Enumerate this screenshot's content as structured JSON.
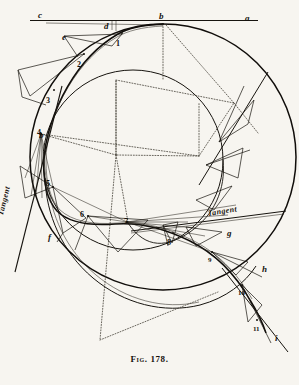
{
  "figure": {
    "caption": "Fig. 178.",
    "background_color": "#f7f5f0",
    "ink_color": "#15120e"
  },
  "annotations": {
    "tangent_left": "Tangent",
    "tangent_right": "Tangent"
  },
  "letter_labels": [
    {
      "id": "c",
      "text": "c",
      "x": 38,
      "y": 11
    },
    {
      "id": "d",
      "text": "d",
      "x": 104,
      "y": 22
    },
    {
      "id": "b",
      "text": "b",
      "x": 159,
      "y": 12
    },
    {
      "id": "a",
      "text": "a",
      "x": 245,
      "y": 14
    },
    {
      "id": "e",
      "text": "e",
      "x": 62,
      "y": 33
    },
    {
      "id": "b2",
      "text": "b",
      "x": 39,
      "y": 131
    },
    {
      "id": "f",
      "text": "f",
      "x": 48,
      "y": 233
    },
    {
      "id": "g",
      "text": "g",
      "x": 227,
      "y": 229
    },
    {
      "id": "h",
      "text": "h",
      "x": 262,
      "y": 265
    },
    {
      "id": "i",
      "text": "i",
      "x": 275,
      "y": 334
    }
  ],
  "number_labels": [
    {
      "id": "1",
      "text": "1",
      "x": 116,
      "y": 40
    },
    {
      "id": "2",
      "text": "2",
      "x": 77,
      "y": 61
    },
    {
      "id": "3",
      "text": "3",
      "x": 46,
      "y": 97
    },
    {
      "id": "4",
      "text": "4",
      "x": 37,
      "y": 129
    },
    {
      "id": "5",
      "text": "5",
      "x": 46,
      "y": 180
    },
    {
      "id": "6",
      "text": "6",
      "x": 80,
      "y": 211
    },
    {
      "id": "7",
      "text": "7",
      "x": 124,
      "y": 218
    },
    {
      "id": "8",
      "text": "8",
      "x": 167,
      "y": 239
    },
    {
      "id": "9",
      "text": "9",
      "x": 208,
      "y": 257
    },
    {
      "id": "10",
      "text": "10",
      "x": 238,
      "y": 290
    },
    {
      "id": "11",
      "text": "11",
      "x": 253,
      "y": 326
    }
  ],
  "geometry": {
    "outer_circle": {
      "cx": 163,
      "cy": 157,
      "r": 133
    },
    "inner_circle": {
      "cx": 133,
      "cy": 160,
      "r": 90
    },
    "base_line": {
      "x1": 30,
      "y1": 20,
      "x2": 258,
      "y2": 20
    },
    "tangent_point": {
      "x": 163,
      "y": 24
    },
    "spiral_points": [
      {
        "n": "b",
        "x": 163,
        "y": 24
      },
      {
        "n": "1",
        "x": 122,
        "y": 33
      },
      {
        "n": "2",
        "x": 84,
        "y": 54
      },
      {
        "n": "3",
        "x": 54,
        "y": 90
      },
      {
        "n": "4",
        "x": 41,
        "y": 134
      },
      {
        "n": "5",
        "x": 53,
        "y": 187
      },
      {
        "n": "6",
        "x": 88,
        "y": 216
      },
      {
        "n": "7",
        "x": 127,
        "y": 222
      },
      {
        "n": "8",
        "x": 173,
        "y": 233
      },
      {
        "n": "9",
        "x": 212,
        "y": 252
      },
      {
        "n": "10",
        "x": 242,
        "y": 285
      },
      {
        "n": "11",
        "x": 257,
        "y": 320
      }
    ]
  }
}
